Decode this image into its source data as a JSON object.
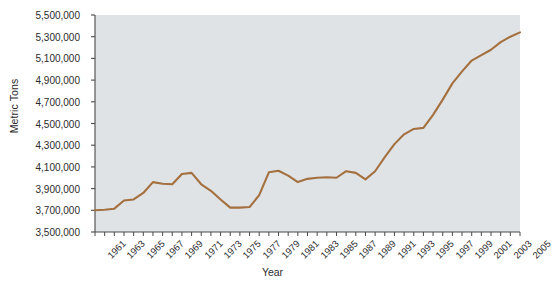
{
  "chart_data": {
    "type": "line",
    "title": "",
    "xlabel": "Year",
    "ylabel": "Metric Tons",
    "ylim": [
      3500000,
      5500000
    ],
    "ytick_step": 200000,
    "ytick_labels": [
      "5,500,000",
      "5,300,000",
      "5,100,000",
      "4,900,000",
      "4,700,000",
      "4,500,000",
      "4,300,000",
      "4,100,000",
      "3,900,000",
      "3,700,000",
      "3,500,000"
    ],
    "ytick_values": [
      5500000,
      5300000,
      5100000,
      4900000,
      4700000,
      4500000,
      4300000,
      4100000,
      3900000,
      3700000,
      3500000
    ],
    "xlim": [
      1961,
      2005
    ],
    "xtick_labels": [
      "1961",
      "1963",
      "1965",
      "1967",
      "1969",
      "1971",
      "1973",
      "1975",
      "1977",
      "1979",
      "1981",
      "1983",
      "1985",
      "1987",
      "1989",
      "1991",
      "1993",
      "1995",
      "1997",
      "1999",
      "2001",
      "2003",
      "2005"
    ],
    "xtick_minor_every_year": true,
    "grid": false,
    "legend": "none",
    "line_color": "#a4703f",
    "plot_background": "#dfe3e6",
    "axis_color": "#4a4a4a",
    "series": [
      {
        "name": "Metric Tons",
        "x": [
          1961,
          1962,
          1963,
          1964,
          1965,
          1966,
          1967,
          1968,
          1969,
          1970,
          1971,
          1972,
          1973,
          1974,
          1975,
          1976,
          1977,
          1978,
          1979,
          1980,
          1981,
          1982,
          1983,
          1984,
          1985,
          1986,
          1987,
          1988,
          1989,
          1990,
          1991,
          1992,
          1993,
          1994,
          1995,
          1996,
          1997,
          1998,
          1999,
          2000,
          2001,
          2002,
          2003,
          2004,
          2005
        ],
        "values": [
          3700000,
          3705000,
          3715000,
          3790000,
          3800000,
          3860000,
          3960000,
          3945000,
          3940000,
          4035000,
          4045000,
          3940000,
          3880000,
          3800000,
          3725000,
          3725000,
          3730000,
          3840000,
          4050000,
          4065000,
          4020000,
          3960000,
          3990000,
          4000000,
          4005000,
          4000000,
          4060000,
          4045000,
          3985000,
          4060000,
          4190000,
          4310000,
          4400000,
          4450000,
          4460000,
          4580000,
          4720000,
          4870000,
          4980000,
          5080000,
          5130000,
          5180000,
          5250000,
          5300000,
          5340000
        ]
      }
    ]
  },
  "axes": {
    "ylabel_text": "Metric Tons",
    "xlabel_text": "Year"
  },
  "footer": {
    "cropped_caption": ""
  }
}
